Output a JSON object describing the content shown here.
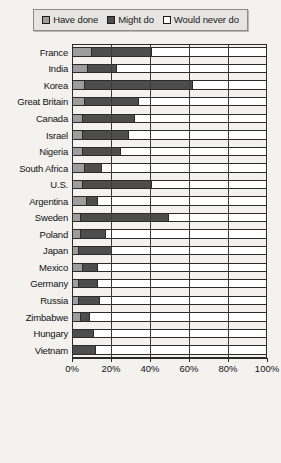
{
  "legend": {
    "items": [
      {
        "label": "Have done",
        "key": "have",
        "color": "#9d9d9d"
      },
      {
        "label": "Might do",
        "key": "might",
        "color": "#4d4d4d"
      },
      {
        "label": "Would never do",
        "key": "never",
        "color": "#ffffff"
      }
    ]
  },
  "chart_data": {
    "type": "bar",
    "orientation": "horizontal",
    "stacked": true,
    "stack_total": 100,
    "title": "",
    "xlabel": "",
    "ylabel": "",
    "xlim": [
      0,
      100
    ],
    "grid": true,
    "legend_position": "top",
    "xticks": [
      0,
      20,
      40,
      60,
      80,
      100
    ],
    "xticklabels": [
      "0%",
      "20%",
      "40%",
      "60%",
      "80%",
      "100%"
    ],
    "categories": [
      "France",
      "India",
      "Korea",
      "Great Britain",
      "Canada",
      "Israel",
      "Nigeria",
      "South Africa",
      "U.S.",
      "Argentina",
      "Sweden",
      "Poland",
      "Japan",
      "Mexico",
      "Germany",
      "Russia",
      "Zimbabwe",
      "Hungary",
      "Vietnam"
    ],
    "series": [
      {
        "name": "Have done",
        "values": [
          10,
          8,
          6,
          6,
          5,
          5,
          5,
          6,
          5,
          7,
          4,
          4,
          3,
          5,
          3,
          3,
          4,
          0,
          0
        ]
      },
      {
        "name": "Might do",
        "values": [
          31,
          15,
          56,
          28,
          27,
          24,
          20,
          9,
          36,
          6,
          46,
          13,
          17,
          8,
          10,
          11,
          5,
          11,
          12
        ]
      },
      {
        "name": "Would never do",
        "values": [
          59,
          77,
          38,
          66,
          68,
          71,
          75,
          85,
          59,
          87,
          50,
          83,
          80,
          87,
          87,
          86,
          91,
          89,
          88
        ]
      }
    ]
  }
}
